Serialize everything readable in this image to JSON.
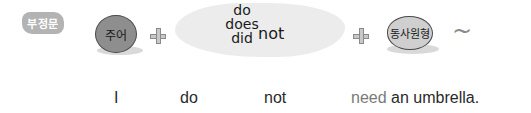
{
  "formula": {
    "label": "부정문",
    "subject": "주어",
    "auxiliaries": [
      "do",
      "does",
      "did"
    ],
    "negation": "not",
    "verb": "동사원형",
    "plus_symbol": "+",
    "tilde": "~"
  },
  "example": {
    "subject": "I",
    "auxiliary": "do",
    "negation": "not",
    "verb": "need",
    "rest": " an umbrella."
  },
  "colors": {
    "badge": "#b3b3b3",
    "subject_ball": "#8e8e8e",
    "verb_ball": "#cfcfcf",
    "highlight_text": "#7a7a7a"
  }
}
